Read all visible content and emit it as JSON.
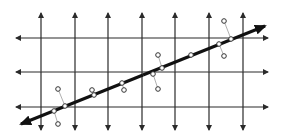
{
  "diagram": {
    "type": "regression-grid",
    "colors": {
      "background": "#ffffff",
      "grid": "#2a2a2a",
      "fit_line": "#111111",
      "projection": "#9a9a9a",
      "point_fill": "#ffffff",
      "point_stroke": "#333333"
    },
    "vertical_lines_x": [
      41,
      75,
      108,
      142,
      175,
      209,
      243
    ],
    "vertical_extent": {
      "top": 13,
      "bottom": 130
    },
    "horizontal_lines_y": [
      38,
      72,
      107
    ],
    "horizontal_extent": {
      "left": 16,
      "right": 268
    },
    "fit_line": {
      "x1": 21,
      "y1": 124,
      "x2": 265,
      "y2": 26
    },
    "on_line_points": [
      [
        65,
        106
      ],
      [
        54,
        111
      ],
      [
        94,
        95
      ],
      [
        122,
        83
      ],
      [
        162,
        68
      ],
      [
        153,
        74
      ],
      [
        191,
        55
      ],
      [
        231,
        39
      ],
      [
        219,
        44
      ]
    ],
    "off_line_points": [
      [
        58,
        89
      ],
      [
        58,
        124
      ],
      [
        92,
        90
      ],
      [
        124,
        90
      ],
      [
        158,
        55
      ],
      [
        158,
        89
      ],
      [
        224,
        21
      ],
      [
        224,
        56
      ]
    ],
    "projections": [
      {
        "from": [
          58,
          89
        ],
        "to": [
          65,
          106
        ]
      },
      {
        "from": [
          54,
          111
        ],
        "to": [
          58,
          124
        ]
      },
      {
        "from": [
          92,
          90
        ],
        "to": [
          94,
          95
        ]
      },
      {
        "from": [
          122,
          83
        ],
        "to": [
          124,
          90
        ]
      },
      {
        "from": [
          158,
          55
        ],
        "to": [
          162,
          68
        ]
      },
      {
        "from": [
          153,
          74
        ],
        "to": [
          158,
          89
        ]
      },
      {
        "from": [
          224,
          21
        ],
        "to": [
          231,
          39
        ]
      },
      {
        "from": [
          219,
          44
        ],
        "to": [
          224,
          56
        ]
      }
    ]
  }
}
